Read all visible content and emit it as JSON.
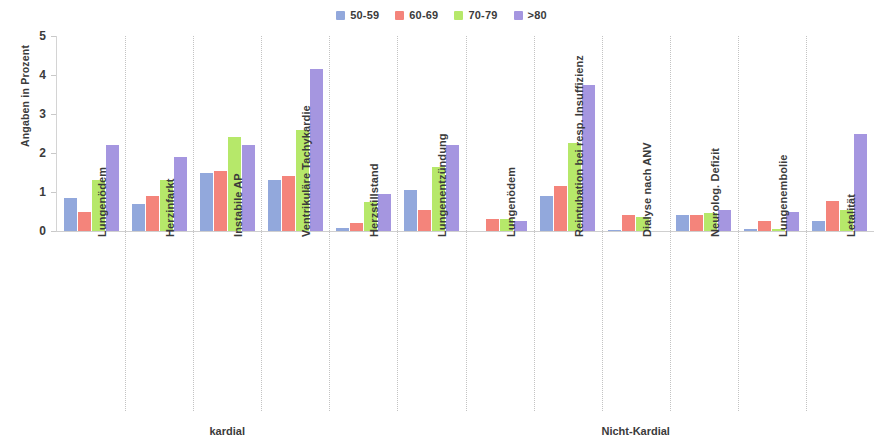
{
  "chart_data": {
    "type": "bar",
    "title": "",
    "xlabel": "",
    "ylabel": "Angaben in Prozent",
    "ylim": [
      0,
      5
    ],
    "yticks": [
      0,
      1,
      2,
      3,
      4,
      5
    ],
    "grid": false,
    "legend_position": "top-center",
    "categories": [
      "Lungenödem",
      "Herzinfarkt",
      "Instabile AP",
      "Ventrikuläre Tachykardie",
      "Herzstillstand",
      "Lungenentzündung",
      "Lungenödem",
      "Reintubation bei resp. Insuffizienz",
      "Dialyse nach ANV",
      "Neurolog. Defizit",
      "Lungenembolie",
      "Letalität"
    ],
    "series": [
      {
        "name": "50-59",
        "color": "#92a8dc",
        "values": [
          0.85,
          0.7,
          1.5,
          1.3,
          0.08,
          1.05,
          0.0,
          0.9,
          0.02,
          0.4,
          0.05,
          0.25
        ]
      },
      {
        "name": "60-69",
        "color": "#f4847b",
        "values": [
          0.5,
          0.9,
          1.55,
          1.4,
          0.2,
          0.55,
          0.3,
          1.15,
          0.4,
          0.4,
          0.25,
          0.78
        ]
      },
      {
        "name": "70-79",
        "color": "#b6e86a",
        "values": [
          1.3,
          1.3,
          2.4,
          2.6,
          0.75,
          1.65,
          0.32,
          2.25,
          0.35,
          0.45,
          0.05,
          0.55
        ]
      },
      {
        "name": ">80",
        "color": "#a596e0",
        "values": [
          2.2,
          1.9,
          2.2,
          4.15,
          0.95,
          2.2,
          0.25,
          3.75,
          0.0,
          0.55,
          0.5,
          2.5
        ]
      }
    ],
    "supergroups": [
      {
        "label": "kardial",
        "start": 0,
        "end": 4
      },
      {
        "label": "Nicht-Kardial",
        "start": 5,
        "end": 11
      }
    ]
  }
}
